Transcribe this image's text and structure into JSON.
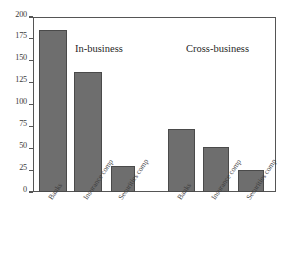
{
  "chart_data": {
    "type": "bar",
    "title": "",
    "subtitle": "",
    "xlabel": "",
    "ylabel": "",
    "ylim": [
      0,
      200
    ],
    "yticks": [
      0,
      25,
      50,
      75,
      100,
      125,
      150,
      175,
      200
    ],
    "ytick_labels": [
      "0",
      "25",
      "50",
      "75",
      "100",
      "125",
      "150",
      "175",
      "200"
    ],
    "grid": false,
    "legend": "none",
    "categories": [
      "Banks",
      "Insurance comp",
      "Securities comp"
    ],
    "groups": [
      "In-business",
      "Cross-business"
    ],
    "annotations": [
      "In-business",
      "Cross-business"
    ],
    "bar_color": "#6e6e6e",
    "bar_edge_color": "#4a4a4a",
    "axis_color": "#555555",
    "bars": [
      {
        "group": "In-business",
        "category": "Banks",
        "value": 185
      },
      {
        "group": "In-business",
        "category": "Insurance comp",
        "value": 137
      },
      {
        "group": "In-business",
        "category": "Securities comp",
        "value": 30
      },
      {
        "group": "Cross-business",
        "category": "Banks",
        "value": 72
      },
      {
        "group": "Cross-business",
        "category": "Insurance comp",
        "value": 52
      },
      {
        "group": "Cross-business",
        "category": "Securities comp",
        "value": 25
      }
    ],
    "series": [
      {
        "name": "In-business",
        "values": [
          185,
          137,
          30
        ]
      },
      {
        "name": "Cross-business",
        "values": [
          72,
          52,
          25
        ]
      }
    ]
  }
}
